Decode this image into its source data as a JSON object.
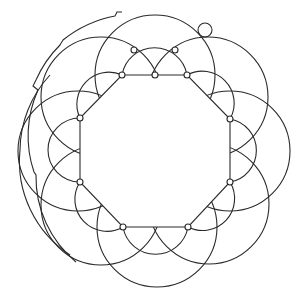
{
  "figure": {
    "colors": {
      "stroke": "#2a2a2a",
      "background": "#ffffff"
    },
    "center": [
      155,
      151
    ],
    "octagon_vertices": [
      [
        122,
        75
      ],
      [
        187,
        75
      ],
      [
        230,
        119
      ],
      [
        230,
        182
      ],
      [
        188,
        227
      ],
      [
        123,
        227
      ],
      [
        80,
        182
      ],
      [
        80,
        118
      ]
    ],
    "edge_midpoints": [
      [
        155,
        75
      ],
      [
        208,
        97
      ],
      [
        230,
        151
      ],
      [
        209,
        204
      ],
      [
        157,
        227
      ],
      [
        101,
        205
      ],
      [
        78,
        151
      ],
      [
        101,
        97
      ]
    ],
    "outer_nodes": [
      [
        134,
        50
      ],
      [
        175,
        50
      ]
    ],
    "top_loop": [
      205,
      30
    ]
  }
}
